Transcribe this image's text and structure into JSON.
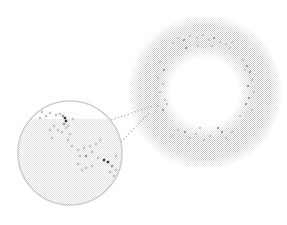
{
  "figure": {
    "width": 287,
    "height": 225,
    "background": "#ffffff",
    "colors": {
      "halo": "#c8c8c8",
      "inset_border": "#cfcfcf",
      "connector": "#b5b5b5",
      "dot_light": "#c4c4c4",
      "dot_mid": "#9a9a9a",
      "dot_dark": "#3a3a3a"
    },
    "main_disc": {
      "cx": 205,
      "cy": 92,
      "r": 77,
      "core_r": 40,
      "ring_dots": [
        [
          173,
          43,
          1
        ],
        [
          178,
          38,
          1
        ],
        [
          184,
          40,
          2
        ],
        [
          190,
          36,
          1
        ],
        [
          197,
          38,
          1
        ],
        [
          203,
          35,
          1
        ],
        [
          209,
          40,
          1
        ],
        [
          214,
          38,
          2
        ],
        [
          220,
          42,
          1
        ],
        [
          226,
          44,
          1
        ],
        [
          232,
          42,
          1
        ],
        [
          230,
          48,
          1
        ],
        [
          186,
          48,
          2
        ],
        [
          198,
          46,
          1
        ],
        [
          212,
          46,
          1
        ],
        [
          243,
          60,
          1
        ],
        [
          247,
          66,
          2
        ],
        [
          250,
          72,
          2
        ],
        [
          245,
          70,
          1
        ],
        [
          252,
          80,
          1
        ],
        [
          248,
          86,
          2
        ],
        [
          254,
          92,
          1
        ],
        [
          249,
          98,
          2
        ],
        [
          246,
          104,
          2
        ],
        [
          252,
          110,
          1
        ],
        [
          240,
          116,
          1
        ],
        [
          160,
          62,
          1
        ],
        [
          164,
          70,
          2
        ],
        [
          158,
          78,
          1
        ],
        [
          163,
          84,
          1
        ],
        [
          160,
          92,
          1
        ],
        [
          165,
          100,
          1
        ],
        [
          158,
          106,
          1
        ],
        [
          163,
          110,
          2
        ],
        [
          167,
          104,
          1
        ],
        [
          178,
          130,
          1
        ],
        [
          185,
          132,
          2
        ],
        [
          190,
          138,
          1
        ],
        [
          196,
          134,
          1
        ],
        [
          204,
          140,
          1
        ],
        [
          210,
          136,
          1
        ],
        [
          218,
          128,
          2
        ],
        [
          222,
          132,
          2
        ],
        [
          226,
          138,
          1
        ],
        [
          232,
          132,
          1
        ],
        [
          172,
          136,
          1
        ],
        [
          200,
          128,
          1
        ]
      ]
    },
    "inset": {
      "cx": 70,
      "cy": 153,
      "r": 52,
      "dots": [
        [
          42,
          112,
          1
        ],
        [
          46,
          116,
          1
        ],
        [
          40,
          118,
          1
        ],
        [
          50,
          113,
          1
        ],
        [
          56,
          115,
          1
        ],
        [
          60,
          114,
          1
        ],
        [
          63,
          116,
          2
        ],
        [
          65,
          118,
          3
        ],
        [
          66,
          121,
          3
        ],
        [
          64,
          124,
          2
        ],
        [
          68,
          126,
          1
        ],
        [
          73,
          119,
          1
        ],
        [
          50,
          130,
          1
        ],
        [
          54,
          126,
          1
        ],
        [
          58,
          130,
          1
        ],
        [
          62,
          132,
          1
        ],
        [
          66,
          128,
          1
        ],
        [
          70,
          134,
          1
        ],
        [
          52,
          138,
          1
        ],
        [
          68,
          140,
          1
        ],
        [
          72,
          146,
          1
        ],
        [
          78,
          150,
          1
        ],
        [
          84,
          148,
          1
        ],
        [
          90,
          146,
          1
        ],
        [
          96,
          144,
          1
        ],
        [
          100,
          140,
          1
        ],
        [
          80,
          156,
          1
        ],
        [
          86,
          156,
          2
        ],
        [
          92,
          152,
          1
        ],
        [
          98,
          158,
          1
        ],
        [
          104,
          160,
          3
        ],
        [
          108,
          162,
          3
        ],
        [
          112,
          166,
          2
        ],
        [
          116,
          156,
          1
        ],
        [
          116,
          170,
          1
        ],
        [
          114,
          176,
          1
        ],
        [
          110,
          172,
          1
        ],
        [
          78,
          164,
          1
        ],
        [
          86,
          168,
          1
        ],
        [
          92,
          166,
          1
        ],
        [
          82,
          170,
          1
        ]
      ]
    },
    "connectors": [
      {
        "x1": 111,
        "y1": 120,
        "x2": 152,
        "y2": 106
      },
      {
        "x1": 121,
        "y1": 142,
        "x2": 150,
        "y2": 112
      }
    ]
  }
}
